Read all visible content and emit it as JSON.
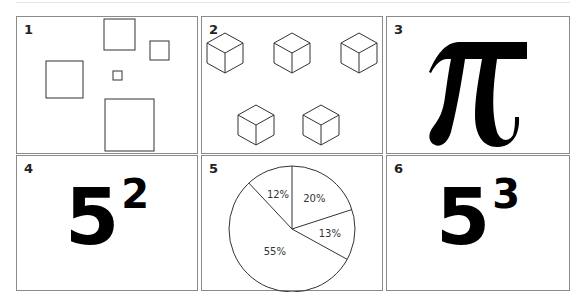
{
  "panels": [
    {
      "number": "1",
      "content": "squares",
      "squares": [
        {
          "x": 87,
          "y": 2,
          "w": 31,
          "h": 31
        },
        {
          "x": 133,
          "y": 24,
          "w": 19,
          "h": 19
        },
        {
          "x": 29,
          "y": 44,
          "w": 37,
          "h": 37
        },
        {
          "x": 96,
          "y": 54,
          "w": 9,
          "h": 9
        },
        {
          "x": 88,
          "y": 82,
          "w": 49,
          "h": 52
        }
      ]
    },
    {
      "number": "2",
      "content": "cubes",
      "cubes": [
        {
          "cx": 23,
          "cy": 36
        },
        {
          "cx": 90,
          "cy": 36
        },
        {
          "cx": 157,
          "cy": 36
        },
        {
          "cx": 54,
          "cy": 108
        },
        {
          "cx": 119,
          "cy": 108
        }
      ]
    },
    {
      "number": "3",
      "content": "symbol",
      "symbol": "π"
    },
    {
      "number": "4",
      "content": "power",
      "base": "5",
      "exponent": "2"
    },
    {
      "number": "5",
      "content": "pie chart"
    },
    {
      "number": "6",
      "content": "power",
      "base": "5",
      "exponent": "3"
    }
  ],
  "chart_data": {
    "type": "pie",
    "title": "",
    "labels": [
      "20%",
      "13%",
      "55%",
      "12%"
    ],
    "values": [
      20,
      13,
      55,
      12
    ],
    "order": "clockwise from 12 o'clock",
    "legend": "none",
    "fill": "white with black outlines"
  }
}
